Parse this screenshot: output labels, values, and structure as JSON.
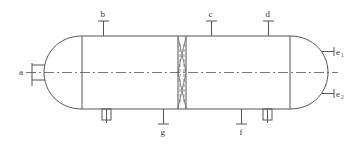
{
  "diagram": {
    "labels": {
      "a": "a",
      "b": "b",
      "c": "c",
      "d": "d",
      "e1_main": "e",
      "e1_sub": "1",
      "e2_main": "e",
      "e2_sub": "2",
      "f": "f",
      "g": "g"
    },
    "nozzles": [
      {
        "id": "a",
        "position": "left head, on centerline"
      },
      {
        "id": "b",
        "position": "top of shell, left section"
      },
      {
        "id": "c",
        "position": "top of shell, right section"
      },
      {
        "id": "d",
        "position": "top of shell, near right head"
      },
      {
        "id": "e1",
        "position": "right head, upper"
      },
      {
        "id": "e2",
        "position": "right head, lower"
      },
      {
        "id": "f",
        "position": "bottom of shell, right section"
      },
      {
        "id": "g",
        "position": "bottom of shell, left section"
      }
    ],
    "components": [
      "left hemispherical head",
      "cylindrical shell",
      "internal baffle/separator",
      "right hemispherical head",
      "two saddle supports",
      "centerline"
    ],
    "colors": {
      "line": "#555555",
      "text": "#333333",
      "background": "#ffffff"
    }
  }
}
